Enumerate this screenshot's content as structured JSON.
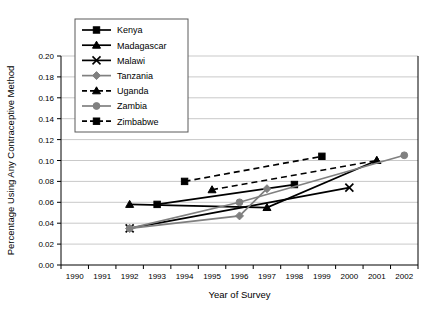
{
  "chart_data": {
    "type": "line",
    "title": "",
    "xlabel": "Year of Survey",
    "ylabel": "Percentage Using Any Contraceptive Method",
    "xlim": [
      1989.5,
      2002.5
    ],
    "ylim": [
      0.0,
      0.2
    ],
    "ytick_labels": [
      "0.00",
      "0.02",
      "0.04",
      "0.06",
      "0.08",
      "0.10",
      "0.12",
      "0.14",
      "0.16",
      "0.18",
      "0.20"
    ],
    "ytick_values": [
      0.0,
      0.02,
      0.04,
      0.06,
      0.08,
      0.1,
      0.12,
      0.14,
      0.16,
      0.18,
      0.2
    ],
    "xtick_labels": [
      "1990",
      "1991",
      "1992",
      "1993",
      "1994",
      "1995",
      "1996",
      "1997",
      "1998",
      "1999",
      "2000",
      "2001",
      "2002"
    ],
    "xtick_values": [
      1990,
      1991,
      1992,
      1993,
      1994,
      1995,
      1996,
      1997,
      1998,
      1999,
      2000,
      2001,
      2002
    ],
    "grid": "horizontal",
    "legend_position": "top-left-inside",
    "series": [
      {
        "name": "Kenya",
        "marker": "square",
        "color": "#000000",
        "dash": "solid",
        "x": [
          1993,
          1998
        ],
        "values": [
          0.058,
          0.077
        ]
      },
      {
        "name": "Madagascar",
        "marker": "triangle",
        "color": "#000000",
        "dash": "solid",
        "x": [
          1992,
          1997,
          2001
        ],
        "values": [
          0.058,
          0.055,
          0.1
        ]
      },
      {
        "name": "Malawi",
        "marker": "cross",
        "color": "#000000",
        "dash": "solid",
        "x": [
          1992,
          2000
        ],
        "values": [
          0.035,
          0.074
        ]
      },
      {
        "name": "Tanzania",
        "marker": "diamond",
        "color": "#808080",
        "dash": "solid",
        "x": [
          1992,
          1996,
          1997
        ],
        "values": [
          0.035,
          0.047,
          0.073
        ]
      },
      {
        "name": "Uganda",
        "marker": "triangle",
        "color": "#000000",
        "dash": "dashed",
        "x": [
          1995,
          2001
        ],
        "values": [
          0.072,
          0.1
        ]
      },
      {
        "name": "Zambia",
        "marker": "circle",
        "color": "#808080",
        "dash": "solid",
        "x": [
          1992,
          1996,
          2002
        ],
        "values": [
          0.035,
          0.06,
          0.105
        ]
      },
      {
        "name": "Zimbabwe",
        "marker": "square",
        "color": "#000000",
        "dash": "dashed",
        "x": [
          1994,
          1999
        ],
        "values": [
          0.08,
          0.104
        ]
      }
    ]
  },
  "legend": {
    "items": [
      {
        "label": "Kenya"
      },
      {
        "label": "Madagascar"
      },
      {
        "label": "Malawi"
      },
      {
        "label": "Tanzania"
      },
      {
        "label": "Uganda"
      },
      {
        "label": "Zambia"
      },
      {
        "label": "Zimbabwe"
      }
    ]
  }
}
